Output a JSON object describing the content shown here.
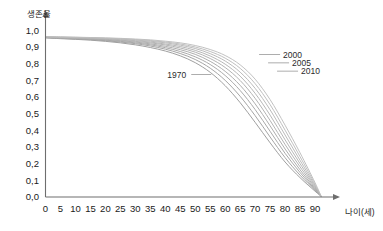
{
  "chart_data": {
    "type": "line",
    "title": "",
    "xlabel": "나이(세)",
    "ylabel": "생존율",
    "xlim": [
      0,
      95
    ],
    "ylim": [
      0.0,
      1.05
    ],
    "grid": false,
    "legend_position": "inline-annotations",
    "x_ticks": [
      "0",
      "5",
      "10",
      "15",
      "20",
      "25",
      "30",
      "35",
      "40",
      "45",
      "50",
      "55",
      "60",
      "65",
      "70",
      "75",
      "80",
      "85",
      "90"
    ],
    "x_tick_values": [
      0,
      5,
      10,
      15,
      20,
      25,
      30,
      35,
      40,
      45,
      50,
      55,
      60,
      65,
      70,
      75,
      80,
      85,
      90
    ],
    "y_ticks": [
      "0,0",
      "0,1",
      "0,2",
      "0,3",
      "0,4",
      "0,5",
      "0,6",
      "0,7",
      "0,8",
      "0,9",
      "1,0"
    ],
    "y_tick_values": [
      0.0,
      0.1,
      0.2,
      0.3,
      0.4,
      0.5,
      0.6,
      0.7,
      0.8,
      0.9,
      1.0
    ],
    "annotations": [
      {
        "label": "1970",
        "x": 48,
        "y": 0.735
      },
      {
        "label": "2000",
        "x": 78,
        "y": 0.855
      },
      {
        "label": "2005",
        "x": 81,
        "y": 0.805
      },
      {
        "label": "2010",
        "x": 84,
        "y": 0.755
      }
    ],
    "x": [
      0,
      5,
      10,
      15,
      20,
      25,
      30,
      35,
      40,
      45,
      50,
      55,
      60,
      65,
      70,
      75,
      80,
      85,
      90,
      92
    ],
    "series": [
      {
        "name": "1970",
        "color": "#9a9a9a",
        "values": [
          0.955,
          0.95,
          0.946,
          0.941,
          0.934,
          0.925,
          0.913,
          0.897,
          0.876,
          0.847,
          0.806,
          0.748,
          0.668,
          0.566,
          0.448,
          0.325,
          0.21,
          0.116,
          0.035,
          0.005
        ]
      },
      {
        "name": "1975",
        "color": "#9f9f9f",
        "values": [
          0.956,
          0.952,
          0.948,
          0.944,
          0.938,
          0.93,
          0.92,
          0.906,
          0.887,
          0.861,
          0.825,
          0.773,
          0.7,
          0.604,
          0.488,
          0.36,
          0.236,
          0.131,
          0.04,
          0.005
        ]
      },
      {
        "name": "1980",
        "color": "#a4a4a4",
        "values": [
          0.957,
          0.953,
          0.95,
          0.946,
          0.941,
          0.934,
          0.925,
          0.913,
          0.896,
          0.873,
          0.841,
          0.795,
          0.729,
          0.639,
          0.525,
          0.394,
          0.262,
          0.147,
          0.045,
          0.005
        ]
      },
      {
        "name": "1985",
        "color": "#a9a9a9",
        "values": [
          0.958,
          0.955,
          0.952,
          0.948,
          0.944,
          0.938,
          0.93,
          0.919,
          0.904,
          0.884,
          0.856,
          0.814,
          0.754,
          0.67,
          0.559,
          0.427,
          0.288,
          0.163,
          0.05,
          0.005
        ]
      },
      {
        "name": "1990",
        "color": "#aeaeae",
        "values": [
          0.959,
          0.956,
          0.953,
          0.95,
          0.946,
          0.941,
          0.934,
          0.925,
          0.912,
          0.894,
          0.869,
          0.831,
          0.777,
          0.699,
          0.592,
          0.459,
          0.315,
          0.181,
          0.056,
          0.005
        ]
      },
      {
        "name": "1995",
        "color": "#b2b2b2",
        "values": [
          0.96,
          0.957,
          0.955,
          0.952,
          0.949,
          0.944,
          0.938,
          0.93,
          0.918,
          0.903,
          0.88,
          0.846,
          0.797,
          0.725,
          0.622,
          0.491,
          0.343,
          0.2,
          0.062,
          0.005
        ]
      },
      {
        "name": "2000",
        "color": "#b6b6b6",
        "values": [
          0.961,
          0.958,
          0.956,
          0.954,
          0.951,
          0.947,
          0.942,
          0.935,
          0.925,
          0.911,
          0.891,
          0.86,
          0.816,
          0.749,
          0.652,
          0.523,
          0.372,
          0.22,
          0.069,
          0.005
        ]
      },
      {
        "name": "2005",
        "color": "#bababa",
        "values": [
          0.962,
          0.96,
          0.958,
          0.956,
          0.953,
          0.95,
          0.945,
          0.939,
          0.93,
          0.918,
          0.9,
          0.873,
          0.833,
          0.772,
          0.68,
          0.554,
          0.401,
          0.242,
          0.077,
          0.005
        ]
      },
      {
        "name": "2010",
        "color": "#bebebe",
        "values": [
          0.963,
          0.961,
          0.959,
          0.957,
          0.955,
          0.952,
          0.948,
          0.943,
          0.935,
          0.925,
          0.909,
          0.885,
          0.849,
          0.793,
          0.707,
          0.584,
          0.431,
          0.265,
          0.086,
          0.005
        ]
      }
    ]
  }
}
